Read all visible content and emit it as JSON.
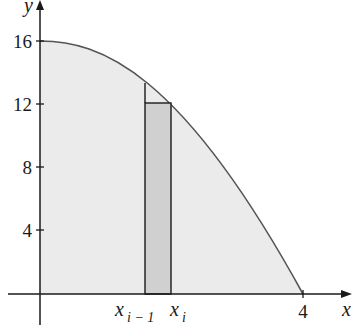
{
  "diagram": {
    "title": "",
    "function": "y = 16 - x^2",
    "axes": {
      "x_label": "x",
      "y_label": "y",
      "y_ticks": [
        "4",
        "8",
        "12",
        "16"
      ],
      "x_ticks": [
        "4"
      ]
    },
    "rectangle_labels": {
      "left": "x",
      "left_sub": "i − 1",
      "right": "x",
      "right_sub": "i"
    },
    "colors": {
      "region_fill": "#ebebeb",
      "rect_fill": "#d0d0d0",
      "stroke": "#1a1a1a",
      "curve": "#555555"
    }
  }
}
